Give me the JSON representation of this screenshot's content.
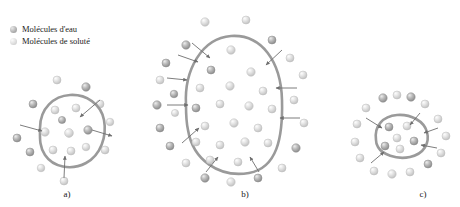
{
  "figure": {
    "title_alt": "Osmose : trois etats cellulaires",
    "background_color": "#ffffff",
    "membrane_color": "#9a9a9a",
    "arrow_color": "#6e6e6e"
  },
  "legend": {
    "items": [
      {
        "icon": "water-molecule-sphere-icon",
        "label": "Molécules d'eau",
        "color": "#a8a8a8",
        "highlight": "#dcdcdc"
      },
      {
        "icon": "solute-molecule-sphere-icon",
        "label": "Molécules de soluté",
        "color": "#d2d2d2",
        "highlight": "#f0f0f0"
      }
    ]
  },
  "panels": [
    {
      "id": "a",
      "label": "a)",
      "description": "Cellule en milieu isotonique",
      "membrane": {
        "cx": 67,
        "cy": 131,
        "path": "M 40 128 C 40 108, 54 96, 70 95 C 86 94, 101 104, 104 120 C 107 136, 101 155, 86 163 C 71 171, 53 167, 45 155 C 39 146, 40 137, 40 128 Z"
      },
      "arrows": [
        {
          "name": "arrow-inward-upper-right",
          "x1": 100,
          "y1": 100,
          "x2": 80,
          "y2": 117,
          "direction": "in"
        },
        {
          "name": "arrow-outward-right",
          "x1": 92,
          "y1": 130,
          "x2": 112,
          "y2": 136,
          "direction": "out"
        },
        {
          "name": "arrow-inward-left",
          "x1": 20,
          "y1": 125,
          "x2": 42,
          "y2": 131,
          "direction": "in"
        },
        {
          "name": "arrow-inward-bottom",
          "x1": 64,
          "y1": 178,
          "x2": 65,
          "y2": 156,
          "direction": "in"
        }
      ],
      "molecules_inside": [
        {
          "type": "solute",
          "x": 55,
          "y": 110,
          "r": 4.0
        },
        {
          "type": "solute",
          "x": 76,
          "y": 108,
          "r": 4.0
        },
        {
          "type": "solute",
          "x": 45,
          "y": 132,
          "r": 4.2
        },
        {
          "type": "solute",
          "x": 69,
          "y": 133,
          "r": 4.4
        },
        {
          "type": "water",
          "x": 88,
          "y": 130,
          "r": 4.2
        },
        {
          "type": "solute",
          "x": 53,
          "y": 150,
          "r": 4.0
        },
        {
          "type": "solute",
          "x": 71,
          "y": 151,
          "r": 4.0
        },
        {
          "type": "solute",
          "x": 86,
          "y": 147,
          "r": 3.8
        },
        {
          "type": "water",
          "x": 62,
          "y": 120,
          "r": 3.6
        }
      ],
      "molecules_outside": [
        {
          "type": "solute",
          "x": 57,
          "y": 80,
          "r": 4.0
        },
        {
          "type": "water",
          "x": 86,
          "y": 87,
          "r": 4.2
        },
        {
          "type": "water",
          "x": 33,
          "y": 104,
          "r": 4.0
        },
        {
          "type": "solute",
          "x": 100,
          "y": 104,
          "r": 4.0
        },
        {
          "type": "solute",
          "x": 110,
          "y": 122,
          "r": 3.8
        },
        {
          "type": "water",
          "x": 17,
          "y": 138,
          "r": 4.0
        },
        {
          "type": "water",
          "x": 30,
          "y": 152,
          "r": 4.0
        },
        {
          "type": "solute",
          "x": 105,
          "y": 150,
          "r": 4.0
        },
        {
          "type": "solute",
          "x": 41,
          "y": 168,
          "r": 3.8
        },
        {
          "type": "solute",
          "x": 64,
          "y": 181,
          "r": 4.0
        }
      ]
    },
    {
      "id": "b",
      "label": "b)",
      "description": "Cellule en milieu hypotonique (gonflement)",
      "membrane": {
        "cx": 232,
        "cy": 110,
        "path": "M 186 105 C 184 70, 202 38, 231 36 C 262 34, 281 62, 282 100 C 283 138, 277 168, 249 173 C 219 178, 193 160, 188 130 C 186 121, 186 113, 186 105 Z"
      },
      "arrows": [
        {
          "name": "arrow-inward-top-left",
          "x1": 192,
          "y1": 43,
          "x2": 210,
          "y2": 58,
          "direction": "in"
        },
        {
          "name": "arrow-inward-upper-left",
          "x1": 178,
          "y1": 55,
          "x2": 198,
          "y2": 62,
          "direction": "in"
        },
        {
          "name": "arrow-inward-left-upper",
          "x1": 167,
          "y1": 78,
          "x2": 187,
          "y2": 80,
          "direction": "in"
        },
        {
          "name": "arrow-inward-left-mid",
          "x1": 167,
          "y1": 105,
          "x2": 188,
          "y2": 105,
          "direction": "in"
        },
        {
          "name": "arrow-inward-left-lower",
          "x1": 182,
          "y1": 143,
          "x2": 199,
          "y2": 128,
          "direction": "in"
        },
        {
          "name": "arrow-inward-bottom-left",
          "x1": 206,
          "y1": 172,
          "x2": 218,
          "y2": 157,
          "direction": "in"
        },
        {
          "name": "arrow-inward-bottom-right",
          "x1": 259,
          "y1": 172,
          "x2": 250,
          "y2": 157,
          "direction": "in"
        },
        {
          "name": "arrow-inward-top-right",
          "x1": 282,
          "y1": 50,
          "x2": 266,
          "y2": 65,
          "direction": "in"
        },
        {
          "name": "arrow-inward-right-upper",
          "x1": 297,
          "y1": 88,
          "x2": 276,
          "y2": 88,
          "direction": "in"
        },
        {
          "name": "arrow-inward-right-mid",
          "x1": 300,
          "y1": 118,
          "x2": 280,
          "y2": 118,
          "direction": "in"
        }
      ],
      "molecules_inside": [
        {
          "type": "solute",
          "x": 231,
          "y": 50,
          "r": 4.2
        },
        {
          "type": "water",
          "x": 211,
          "y": 70,
          "r": 4.0
        },
        {
          "type": "solute",
          "x": 251,
          "y": 72,
          "r": 4.2
        },
        {
          "type": "solute",
          "x": 200,
          "y": 88,
          "r": 4.0
        },
        {
          "type": "solute",
          "x": 230,
          "y": 86,
          "r": 4.2
        },
        {
          "type": "solute",
          "x": 263,
          "y": 91,
          "r": 4.0
        },
        {
          "type": "water",
          "x": 196,
          "y": 108,
          "r": 4.0
        },
        {
          "type": "solute",
          "x": 220,
          "y": 104,
          "r": 4.0
        },
        {
          "type": "solute",
          "x": 249,
          "y": 106,
          "r": 4.2
        },
        {
          "type": "solute",
          "x": 272,
          "y": 109,
          "r": 4.0
        },
        {
          "type": "solute",
          "x": 205,
          "y": 126,
          "r": 4.0
        },
        {
          "type": "solute",
          "x": 234,
          "y": 123,
          "r": 4.2
        },
        {
          "type": "solute",
          "x": 258,
          "y": 128,
          "r": 4.0
        },
        {
          "type": "solute",
          "x": 196,
          "y": 142,
          "r": 4.0
        },
        {
          "type": "solute",
          "x": 220,
          "y": 145,
          "r": 4.0
        },
        {
          "type": "solute",
          "x": 245,
          "y": 142,
          "r": 4.2
        },
        {
          "type": "solute",
          "x": 268,
          "y": 143,
          "r": 4.0
        },
        {
          "type": "solute",
          "x": 210,
          "y": 160,
          "r": 4.0
        },
        {
          "type": "solute",
          "x": 238,
          "y": 162,
          "r": 4.0
        }
      ],
      "molecules_outside": [
        {
          "type": "solute",
          "x": 205,
          "y": 22,
          "r": 4.2
        },
        {
          "type": "solute",
          "x": 246,
          "y": 20,
          "r": 4.0
        },
        {
          "type": "water",
          "x": 186,
          "y": 45,
          "r": 4.2
        },
        {
          "type": "water",
          "x": 272,
          "y": 40,
          "r": 4.0
        },
        {
          "type": "water",
          "x": 166,
          "y": 63,
          "r": 4.0
        },
        {
          "type": "solute",
          "x": 290,
          "y": 58,
          "r": 4.0
        },
        {
          "type": "solute",
          "x": 160,
          "y": 80,
          "r": 4.0
        },
        {
          "type": "water",
          "x": 174,
          "y": 94,
          "r": 3.8
        },
        {
          "type": "solute",
          "x": 303,
          "y": 75,
          "r": 4.0
        },
        {
          "type": "water",
          "x": 157,
          "y": 105,
          "r": 4.2
        },
        {
          "type": "solute",
          "x": 294,
          "y": 100,
          "r": 4.0
        },
        {
          "type": "water",
          "x": 160,
          "y": 128,
          "r": 4.0
        },
        {
          "type": "solute",
          "x": 304,
          "y": 123,
          "r": 4.0
        },
        {
          "type": "water",
          "x": 170,
          "y": 146,
          "r": 4.0
        },
        {
          "type": "water",
          "x": 296,
          "y": 148,
          "r": 4.2
        },
        {
          "type": "solute",
          "x": 186,
          "y": 163,
          "r": 4.0
        },
        {
          "type": "solute",
          "x": 282,
          "y": 168,
          "r": 4.0
        },
        {
          "type": "water",
          "x": 205,
          "y": 178,
          "r": 4.2
        },
        {
          "type": "solute",
          "x": 231,
          "y": 182,
          "r": 4.2
        },
        {
          "type": "water",
          "x": 258,
          "y": 178,
          "r": 4.0
        },
        {
          "type": "solute",
          "x": 175,
          "y": 113,
          "r": 3.6
        }
      ]
    },
    {
      "id": "c",
      "label": "c)",
      "description": "Cellule en milieu hypertonique (plasmolyse)",
      "membrane": {
        "cx": 398,
        "cy": 135,
        "path": "M 376 140 C 374 126, 383 116, 397 115 C 411 114, 424 121, 427 132 C 430 143, 424 154, 410 157 C 396 160, 382 154, 378 147 C 376 144, 376 142, 376 140 Z"
      },
      "arrows": [
        {
          "name": "arrow-inward-upper-left",
          "x1": 366,
          "y1": 118,
          "x2": 382,
          "y2": 128,
          "direction": "in"
        },
        {
          "name": "arrow-inward-upper-right",
          "x1": 420,
          "y1": 113,
          "x2": 410,
          "y2": 125,
          "direction": "in"
        },
        {
          "name": "arrow-inward-right-upper",
          "x1": 438,
          "y1": 128,
          "x2": 424,
          "y2": 133,
          "direction": "in"
        },
        {
          "name": "arrow-inward-right-lower",
          "x1": 437,
          "y1": 148,
          "x2": 421,
          "y2": 145,
          "direction": "in"
        },
        {
          "name": "arrow-inward-bottom-left",
          "x1": 371,
          "y1": 163,
          "x2": 384,
          "y2": 152,
          "direction": "in"
        }
      ],
      "molecules_inside": [
        {
          "type": "water",
          "x": 389,
          "y": 127,
          "r": 4.0
        },
        {
          "type": "solute",
          "x": 407,
          "y": 126,
          "r": 4.0
        },
        {
          "type": "solute",
          "x": 397,
          "y": 138,
          "r": 4.0
        },
        {
          "type": "water",
          "x": 385,
          "y": 146,
          "r": 4.0
        },
        {
          "type": "solute",
          "x": 400,
          "y": 149,
          "r": 4.0
        },
        {
          "type": "water",
          "x": 414,
          "y": 141,
          "r": 4.0
        }
      ],
      "molecules_outside": [
        {
          "type": "water",
          "x": 383,
          "y": 98,
          "r": 4.2
        },
        {
          "type": "solute",
          "x": 397,
          "y": 95,
          "r": 4.0
        },
        {
          "type": "water",
          "x": 411,
          "y": 97,
          "r": 4.2
        },
        {
          "type": "solute",
          "x": 425,
          "y": 104,
          "r": 4.0
        },
        {
          "type": "solute",
          "x": 366,
          "y": 108,
          "r": 4.0
        },
        {
          "type": "solute",
          "x": 438,
          "y": 119,
          "r": 4.0
        },
        {
          "type": "solute",
          "x": 357,
          "y": 124,
          "r": 4.0
        },
        {
          "type": "solute",
          "x": 446,
          "y": 136,
          "r": 4.0
        },
        {
          "type": "solute",
          "x": 355,
          "y": 142,
          "r": 4.0
        },
        {
          "type": "solute",
          "x": 441,
          "y": 153,
          "r": 4.0
        },
        {
          "type": "solute",
          "x": 360,
          "y": 158,
          "r": 4.0
        },
        {
          "type": "water",
          "x": 428,
          "y": 164,
          "r": 4.0
        },
        {
          "type": "solute",
          "x": 374,
          "y": 171,
          "r": 4.0
        },
        {
          "type": "solute",
          "x": 392,
          "y": 174,
          "r": 4.2
        },
        {
          "type": "solute",
          "x": 410,
          "y": 172,
          "r": 4.0
        }
      ]
    }
  ]
}
